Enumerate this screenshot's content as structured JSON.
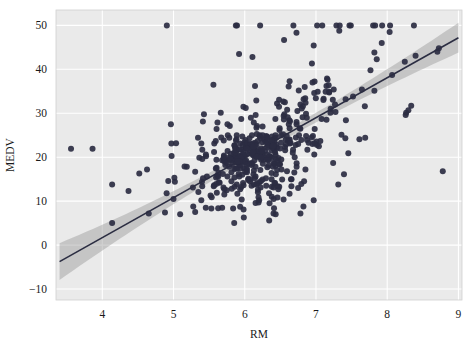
{
  "chart_data": {
    "type": "scatter",
    "title": "",
    "subtitle": "",
    "xlabel": "RM",
    "ylabel": "MEDV",
    "xlim": [
      3.35,
      9.05
    ],
    "ylim": [
      -12.5,
      53.5
    ],
    "xticks": [
      4,
      5,
      6,
      7,
      8,
      9
    ],
    "xtick_labels": [
      "4",
      "5",
      "6",
      "7",
      "8",
      "9"
    ],
    "yticks": [
      -10,
      0,
      10,
      20,
      30,
      40,
      50
    ],
    "ytick_labels": [
      "−10",
      "0",
      "10",
      "20",
      "30",
      "40",
      "50"
    ],
    "grid": true,
    "grid_color": "#ffffff",
    "plot_background": "#eaeaea",
    "figure_background": "#ffffff",
    "legend": null,
    "point_color": "#2b2d42",
    "point_size": 3,
    "regression": {
      "type": "linear",
      "line_color": "#2b2d42",
      "band_color": "#9a9a9a",
      "band_opacity": 0.45,
      "slope": 9.1,
      "intercept": -34.7,
      "x_start": 3.4,
      "x_end": 9.0,
      "y_start": -3.76,
      "y_end": 47.2,
      "band_halfwidth_at_xstart": 4.2,
      "band_halfwidth_at_center": 0.9,
      "band_halfwidth_at_xend": 3.4
    },
    "x": [
      6.575,
      6.421,
      7.185,
      6.998,
      7.147,
      6.43,
      6.012,
      6.172,
      5.631,
      6.004,
      6.377,
      6.009,
      5.889,
      5.949,
      6.096,
      5.834,
      5.935,
      5.99,
      5.456,
      5.727,
      5.57,
      5.965,
      6.142,
      5.813,
      5.924,
      5.599,
      5.813,
      6.047,
      6.495,
      6.674,
      5.713,
      6.072,
      5.95,
      5.701,
      6.096,
      5.933,
      5.841,
      5.85,
      5.966,
      6.595,
      7.024,
      6.77,
      6.169,
      6.211,
      6.069,
      5.682,
      5.786,
      6.03,
      5.399,
      5.602,
      5.963,
      6.115,
      6.511,
      5.998,
      5.888,
      7.249,
      6.383,
      6.816,
      6.145,
      5.927,
      5.741,
      5.966,
      6.456,
      6.762,
      7.104,
      6.29,
      5.787,
      5.878,
      5.594,
      5.885,
      6.417,
      5.961,
      6.065,
      6.245,
      6.273,
      6.286,
      6.279,
      6.14,
      6.232,
      5.874,
      6.727,
      6.619,
      6.302,
      6.167,
      6.389,
      6.63,
      6.015,
      6.121,
      7.007,
      7.079,
      6.417,
      6.405,
      6.442,
      6.211,
      6.249,
      6.625,
      6.163,
      8.069,
      7.82,
      7.416,
      6.727,
      6.781,
      6.405,
      6.137,
      6.167,
      5.851,
      5.836,
      6.127,
      6.474,
      6.229,
      6.195,
      6.715,
      5.913,
      6.092,
      6.254,
      5.928,
      6.176,
      6.021,
      5.872,
      5.731,
      5.87,
      6.004,
      5.961,
      5.856,
      5.879,
      5.986,
      5.613,
      5.693,
      6.431,
      5.637,
      6.458,
      6.326,
      6.372,
      5.822,
      5.757,
      6.335,
      5.942,
      6.454,
      5.857,
      6.151,
      6.174,
      5.019,
      5.403,
      5.468,
      4.903,
      6.13,
      5.628,
      4.926,
      5.186,
      5.597,
      6.122,
      5.404,
      5.012,
      5.709,
      6.129,
      6.152,
      5.272,
      6.943,
      6.066,
      6.51,
      6.25,
      7.489,
      7.802,
      8.375,
      5.854,
      6.101,
      7.929,
      5.877,
      6.319,
      6.402,
      5.875,
      5.88,
      5.572,
      6.416,
      5.859,
      6.546,
      6.02,
      6.315,
      6.86,
      6.98,
      7.765,
      6.144,
      7.155,
      6.563,
      5.604,
      6.153,
      7.831,
      6.782,
      6.556,
      7.185,
      6.951,
      6.739,
      7.178,
      6.8,
      6.604,
      7.287,
      7.107,
      7.274,
      6.975,
      7.135,
      6.162,
      7.61,
      7.853,
      8.034,
      5.891,
      6.326,
      5.783,
      6.064,
      5.344,
      5.96,
      5.404,
      5.807,
      6.375,
      5.412,
      6.182,
      5.888,
      6.642,
      5.951,
      6.373,
      6.951,
      6.164,
      6.879,
      6.618,
      8.266,
      8.725,
      8.04,
      7.163,
      7.686,
      6.552,
      5.981,
      7.412,
      8.337,
      8.247,
      6.726,
      6.086,
      6.631,
      7.358,
      6.481,
      6.606,
      6.897,
      6.095,
      6.358,
      6.393,
      5.593,
      5.605,
      6.108,
      6.226,
      6.433,
      6.718,
      6.487,
      6.438,
      6.957,
      8.259,
      6.108,
      5.876,
      7.454,
      8.704,
      7.333,
      6.842,
      7.203,
      7.52,
      8.398,
      7.327,
      7.206,
      5.56,
      7.014,
      8.297,
      7.47,
      5.92,
      5.856,
      6.24,
      6.538,
      7.691,
      6.758,
      6.854,
      7.267,
      6.826,
      6.482,
      6.812,
      7.82,
      6.968,
      7.645,
      7.923,
      7.088,
      6.453,
      6.23,
      6.209,
      6.315,
      6.565,
      6.861,
      7.148,
      6.63,
      6.127,
      6.009,
      6.678,
      6.549,
      5.79,
      6.345,
      7.041,
      6.871,
      6.59,
      6.495,
      6.982,
      7.236,
      6.616,
      7.42,
      6.849,
      6.635,
      5.972,
      4.973,
      6.122,
      6.023,
      6.266,
      6.567,
      5.705,
      5.914,
      5.782,
      6.382,
      6.113,
      6.426,
      6.376,
      6.041,
      5.708,
      6.415,
      6.431,
      6.312,
      6.083,
      5.868,
      6.333,
      6.144,
      5.706,
      6.031,
      6.316,
      6.31,
      6.037,
      5.869,
      5.895,
      6.059,
      5.985,
      5.968,
      7.241,
      6.54,
      6.696,
      6.874,
      6.014,
      5.898,
      6.516,
      6.635,
      6.939,
      6.49,
      6.579,
      5.884,
      6.728,
      5.663,
      5.936,
      6.212,
      6.395,
      6.127,
      6.112,
      6.398,
      6.251,
      5.362,
      5.803,
      8.78,
      3.561,
      4.963,
      3.863,
      4.97,
      6.683,
      7.016,
      6.216,
      5.875,
      4.906,
      4.138,
      7.313,
      6.649,
      6.794,
      6.38,
      6.223,
      6.968,
      6.545,
      5.536,
      5.52,
      4.368,
      5.277,
      4.652,
      5.0,
      4.88,
      5.39,
      5.713,
      6.051,
      5.036,
      6.193,
      5.887,
      6.471,
      6.405,
      5.747,
      5.453,
      5.852,
      5.987,
      6.343,
      6.404,
      5.349,
      5.531,
      5.683,
      4.138,
      5.608,
      5.617,
      6.852,
      5.757,
      6.657,
      4.628,
      5.155,
      4.519,
      6.434,
      6.782,
      5.304,
      5.957,
      6.824,
      6.411,
      6.006,
      5.648,
      6.103,
      5.565,
      5.896,
      5.837,
      6.202,
      6.193,
      6.38,
      6.348,
      6.833,
      6.425,
      6.436,
      6.208,
      6.629,
      6.461,
      6.152,
      5.935,
      5.627,
      5.818,
      6.406,
      6.219,
      6.485,
      5.854,
      6.459,
      6.341,
      6.251,
      6.185,
      6.417,
      6.749,
      6.655,
      6.297,
      7.393,
      6.728,
      6.525,
      5.976,
      5.936,
      6.301,
      6.081,
      6.701,
      6.376,
      6.317,
      6.513,
      6.209,
      5.759,
      5.952,
      6.003,
      5.926,
      5.713,
      6.167,
      6.229,
      6.437,
      6.98,
      5.427,
      6.162,
      6.484,
      5.304,
      6.185,
      6.229,
      6.242,
      6.75,
      7.061,
      5.762,
      5.871,
      6.312,
      6.114,
      5.905,
      5.454,
      5.414,
      5.093,
      5.983,
      5.983,
      5.707,
      5.926,
      5.67,
      5.39,
      5.794,
      6.019,
      5.569,
      6.027,
      6.593,
      6.12,
      6.976,
      6.794,
      6.03
    ],
    "y": [
      24.0,
      21.6,
      34.7,
      33.4,
      36.2,
      28.7,
      22.9,
      27.1,
      16.5,
      18.9,
      15.0,
      18.9,
      21.7,
      20.4,
      18.2,
      19.9,
      23.1,
      17.5,
      20.2,
      18.2,
      13.6,
      19.6,
      15.2,
      14.5,
      15.6,
      13.9,
      16.6,
      14.8,
      18.4,
      21.0,
      12.7,
      14.5,
      13.2,
      13.1,
      13.5,
      18.9,
      20.0,
      21.0,
      24.7,
      30.8,
      34.9,
      26.6,
      25.3,
      24.7,
      21.2,
      19.3,
      20.0,
      16.6,
      14.4,
      19.4,
      19.7,
      20.5,
      25.0,
      23.4,
      18.9,
      35.4,
      24.7,
      31.6,
      23.3,
      19.6,
      18.7,
      16.0,
      22.2,
      25.0,
      33.0,
      23.5,
      19.4,
      22.0,
      17.4,
      20.9,
      24.2,
      21.7,
      22.8,
      23.4,
      24.1,
      21.4,
      20.0,
      20.8,
      21.2,
      20.3,
      28.0,
      23.9,
      24.8,
      22.9,
      23.9,
      26.6,
      22.5,
      22.2,
      23.6,
      28.7,
      22.6,
      22.0,
      22.9,
      25.0,
      20.6,
      28.4,
      21.4,
      38.7,
      43.8,
      33.2,
      27.5,
      26.5,
      18.6,
      19.3,
      20.1,
      19.5,
      19.5,
      20.4,
      19.8,
      19.4,
      21.7,
      22.8,
      18.8,
      18.7,
      18.5,
      18.3,
      21.2,
      19.2,
      20.4,
      19.3,
      22.0,
      20.3,
      20.5,
      17.3,
      18.8,
      21.4,
      15.7,
      16.2,
      18.0,
      14.3,
      19.2,
      19.6,
      23.0,
      18.4,
      15.6,
      18.1,
      17.4,
      17.1,
      13.3,
      17.8,
      14.0,
      14.4,
      13.4,
      15.6,
      11.8,
      13.8,
      15.6,
      14.6,
      17.8,
      15.4,
      21.5,
      19.6,
      15.3,
      19.4,
      17.0,
      15.6,
      13.1,
      41.3,
      24.3,
      23.3,
      27.0,
      50.0,
      50.0,
      50.0,
      22.7,
      25.0,
      50.0,
      23.8,
      23.8,
      22.3,
      17.4,
      19.1,
      23.1,
      23.6,
      22.6,
      29.4,
      23.2,
      24.6,
      29.9,
      37.2,
      39.8,
      36.2,
      37.9,
      32.5,
      26.4,
      29.6,
      50.0,
      32.0,
      29.8,
      34.9,
      37.0,
      30.5,
      36.4,
      31.1,
      29.1,
      50.0,
      33.3,
      30.3,
      34.6,
      34.9,
      32.9,
      24.1,
      42.3,
      48.5,
      50.0,
      22.6,
      24.4,
      22.5,
      24.4,
      20.0,
      21.7,
      19.3,
      22.4,
      28.1,
      23.7,
      25.0,
      23.3,
      28.7,
      21.5,
      23.0,
      26.7,
      21.7,
      27.5,
      30.1,
      44.8,
      50.0,
      37.6,
      31.6,
      46.7,
      31.5,
      24.3,
      31.7,
      41.7,
      48.3,
      29.0,
      24.0,
      25.1,
      31.5,
      23.7,
      23.3,
      22.0,
      20.1,
      22.2,
      23.7,
      17.6,
      18.5,
      24.3,
      20.5,
      24.5,
      26.2,
      24.4,
      24.8,
      29.6,
      42.8,
      21.9,
      20.9,
      44.0,
      50.0,
      36.0,
      30.1,
      33.8,
      43.1,
      48.8,
      31.0,
      36.5,
      22.8,
      30.7,
      50.0,
      43.5,
      20.7,
      21.1,
      25.2,
      24.4,
      35.2,
      32.4,
      32.0,
      33.2,
      33.1,
      29.1,
      35.1,
      45.4,
      35.4,
      46.0,
      50.0,
      32.2,
      22.0,
      20.1,
      23.2,
      22.3,
      24.8,
      28.5,
      37.3,
      27.9,
      23.9,
      21.7,
      28.6,
      27.1,
      20.3,
      22.5,
      29.0,
      24.8,
      22.0,
      26.4,
      33.1,
      36.1,
      28.4,
      33.4,
      28.2,
      22.8,
      20.3,
      16.1,
      22.1,
      19.4,
      21.6,
      23.8,
      16.2,
      17.8,
      19.8,
      23.1,
      21.0,
      23.8,
      23.1,
      20.4,
      18.5,
      25.0,
      24.6,
      23.0,
      22.2,
      19.3,
      22.6,
      19.8,
      17.1,
      19.4,
      22.2,
      20.7,
      21.1,
      19.5,
      18.5,
      20.6,
      19.0,
      18.7,
      32.7,
      16.5,
      23.9,
      31.2,
      17.5,
      17.2,
      23.1,
      24.5,
      26.6,
      22.9,
      24.1,
      18.6,
      30.1,
      18.2,
      20.6,
      17.8,
      21.7,
      22.7,
      22.6,
      25.0,
      19.9,
      20.8,
      16.8,
      21.9,
      27.5,
      21.9,
      23.1,
      50.0,
      50.0,
      50.0,
      50.0,
      50.0,
      13.8,
      13.8,
      15.0,
      13.9,
      13.3,
      13.1,
      10.2,
      10.4,
      10.9,
      11.3,
      12.3,
      8.8,
      7.2,
      10.5,
      7.4,
      10.2,
      11.5,
      15.1,
      23.2,
      9.7,
      13.8,
      12.7,
      13.1,
      12.5,
      8.5,
      5.0,
      6.3,
      5.6,
      7.2,
      12.1,
      8.3,
      8.5,
      5.0,
      11.9,
      27.9,
      17.2,
      27.5,
      15.0,
      17.2,
      17.9,
      16.3,
      7.0,
      7.2,
      7.5,
      10.4,
      8.8,
      8.4,
      16.7,
      14.2,
      20.8,
      13.4,
      11.7,
      8.3,
      10.2,
      10.9,
      11.0,
      9.5,
      14.5,
      14.1,
      16.1,
      14.3,
      11.7,
      13.4,
      9.6,
      8.7,
      8.4,
      12.8,
      10.5,
      17.1,
      18.4,
      15.4,
      10.8,
      11.8,
      14.9,
      12.6,
      14.1,
      13.0,
      13.4,
      15.2,
      16.1,
      17.8,
      14.9,
      14.1,
      12.7,
      13.5,
      14.9,
      20.0,
      16.4,
      17.7,
      19.5,
      20.2,
      21.4,
      19.9,
      19.0,
      19.1,
      19.1,
      20.1,
      19.9,
      19.6,
      23.2,
      29.8,
      13.8,
      13.3,
      16.7,
      12.0,
      14.6,
      21.4,
      23.0,
      23.7,
      25.0,
      21.8,
      20.6,
      21.2,
      19.1,
      20.6,
      15.2,
      7.0,
      8.1,
      13.6,
      20.1,
      21.8,
      24.5,
      23.1,
      19.7,
      18.3,
      21.2,
      17.5,
      16.8,
      22.4,
      20.6,
      23.9,
      22.0,
      11.9
    ]
  },
  "axes": {
    "ylabel": "MEDV",
    "xlabel": "RM"
  }
}
